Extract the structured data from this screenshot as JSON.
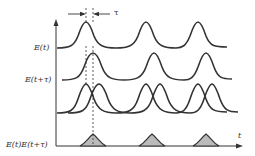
{
  "diagram": {
    "labels": {
      "tau": "τ",
      "row1": "E(t)",
      "row2": "E(t+τ)",
      "row4": "E(t)E(t+τ)",
      "x_axis": "t"
    },
    "colors": {
      "line": "#333333",
      "fill": "#bbbbbb"
    },
    "peaks_row1_x": [
      86,
      147,
      199
    ],
    "shift_tau_px": 8
  }
}
